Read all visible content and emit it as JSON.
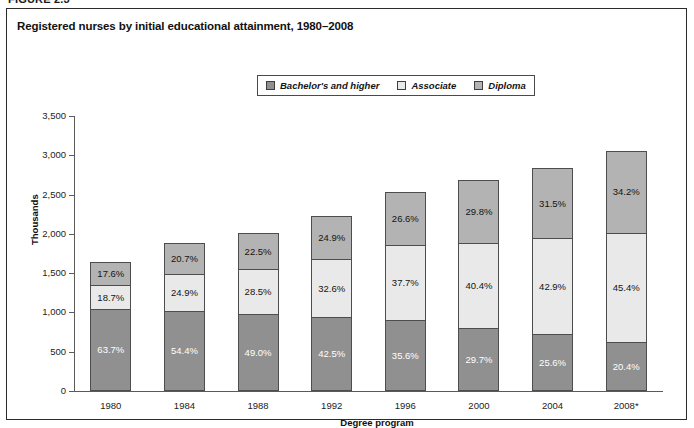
{
  "figure": {
    "label": "FIGURE 2.3"
  },
  "chart_title": "Registered nurses by initial educational attainment, 1980–2008",
  "legend": {
    "position": "top-center",
    "entries": [
      {
        "label": "Bachelor's and higher",
        "color": "#909090",
        "key": "bachelor"
      },
      {
        "label": "Associate",
        "color": "#e9e9e9",
        "key": "associate"
      },
      {
        "label": "Diploma",
        "color": "#b3b3b3",
        "key": "diploma"
      }
    ]
  },
  "chart_data": {
    "type": "bar",
    "stacked": true,
    "title": "Registered nurses by initial educational attainment, 1980–2008",
    "xlabel": "Degree program",
    "ylabel": "Thousands",
    "ylim": [
      0,
      3500
    ],
    "yticks": [
      "0",
      "500",
      "1,000",
      "1,500",
      "2,000",
      "2,500",
      "3,000",
      "3,500"
    ],
    "ytick_values": [
      0,
      500,
      1000,
      1500,
      2000,
      2500,
      3000,
      3500
    ],
    "grid": false,
    "categories": [
      "1980",
      "1984",
      "1988",
      "1992",
      "1996",
      "2000",
      "2004",
      "2008*"
    ],
    "totals_thousands": [
      1640,
      1880,
      2010,
      2230,
      2540,
      2690,
      2840,
      3060
    ],
    "series": [
      {
        "name": "Bachelor's and higher",
        "key": "bachelor",
        "color": "#909090",
        "labels": [
          "63.7%",
          "54.4%",
          "49.0%",
          "42.5%",
          "35.6%",
          "29.7%",
          "25.6%",
          "20.4%"
        ],
        "percents": [
          63.7,
          54.4,
          49.0,
          42.5,
          35.6,
          29.7,
          25.6,
          20.4
        ]
      },
      {
        "name": "Associate",
        "key": "associate",
        "color": "#e9e9e9",
        "labels": [
          "18.7%",
          "24.9%",
          "28.5%",
          "32.6%",
          "37.7%",
          "40.4%",
          "42.9%",
          "45.4%"
        ],
        "percents": [
          18.7,
          24.9,
          28.5,
          32.6,
          37.7,
          40.4,
          42.9,
          45.4
        ]
      },
      {
        "name": "Diploma",
        "key": "diploma",
        "color": "#b3b3b3",
        "labels": [
          "17.6%",
          "20.7%",
          "22.5%",
          "24.9%",
          "26.6%",
          "29.8%",
          "31.5%",
          "34.2%"
        ],
        "percents": [
          17.6,
          20.7,
          22.5,
          24.9,
          26.6,
          29.8,
          31.5,
          34.2
        ]
      }
    ]
  }
}
